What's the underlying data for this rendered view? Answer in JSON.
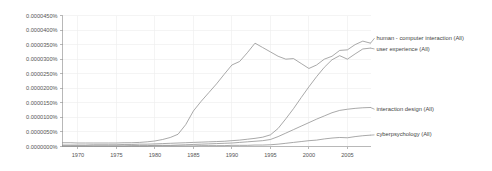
{
  "chart_data": {
    "type": "line",
    "title": "",
    "subtitle": "",
    "xlabel": "",
    "ylabel": "",
    "xlim": [
      1968,
      2008
    ],
    "ylim": [
      0,
      4.5e-05
    ],
    "grid": true,
    "legend_position": "right-inline",
    "y_tick_labels": [
      "0.0000450%",
      "0.0000400%",
      "0.0000350%",
      "0.0000300%",
      "0.0000250%",
      "0.0000200%",
      "0.0000150%",
      "0.0000100%",
      "0.0000050%",
      "0.0000000%"
    ],
    "y_tick_values": [
      4.5e-05,
      4e-05,
      3.5e-05,
      3e-05,
      2.5e-05,
      2e-05,
      1.5e-05,
      1e-05,
      5e-06,
      0.0
    ],
    "x_tick_labels": [
      "1970",
      "1975",
      "1980",
      "1985",
      "1990",
      "1995",
      "2000",
      "2005"
    ],
    "x_tick_values": [
      1970,
      1975,
      1980,
      1985,
      1990,
      1995,
      2000,
      2005
    ],
    "x": [
      1968,
      1969,
      1970,
      1971,
      1972,
      1973,
      1974,
      1975,
      1976,
      1977,
      1978,
      1979,
      1980,
      1981,
      1982,
      1983,
      1984,
      1985,
      1986,
      1987,
      1988,
      1989,
      1990,
      1991,
      1992,
      1993,
      1994,
      1995,
      1996,
      1997,
      1998,
      1999,
      2000,
      2001,
      2002,
      2003,
      2004,
      2005,
      2006,
      2007,
      2008
    ],
    "series": [
      {
        "name": "human - computer interaction (All)",
        "color": "#8c8c8c",
        "label_x": 2008,
        "label_y": 3.72e-05,
        "values": [
          1.3e-06,
          1.3e-06,
          1.2e-06,
          1.2e-06,
          1.2e-06,
          1.2e-06,
          1.2e-06,
          1.2e-06,
          1.3e-06,
          1.3e-06,
          1.4e-06,
          1.6e-06,
          1.9e-06,
          2.4e-06,
          3.1e-06,
          4.2e-06,
          7.5e-06,
          1.22e-05,
          1.55e-05,
          1.85e-05,
          2.15e-05,
          2.48e-05,
          2.8e-05,
          2.92e-05,
          3.22e-05,
          3.55e-05,
          3.4e-05,
          3.25e-05,
          3.1e-05,
          3e-05,
          3.02e-05,
          2.85e-05,
          2.68e-05,
          2.8e-05,
          3e-05,
          3.1e-05,
          3.3e-05,
          3.32e-05,
          3.5e-05,
          3.62e-05,
          3.55e-05
        ]
      },
      {
        "name": "user experience (All)",
        "color": "#8c8c8c",
        "label_x": 2008,
        "label_y": 3.35e-05,
        "values": [
          5e-07,
          5e-07,
          5e-07,
          5e-07,
          6e-07,
          6e-07,
          6e-07,
          6e-07,
          7e-07,
          7e-07,
          8e-07,
          8e-07,
          9e-07,
          1e-06,
          1.1e-06,
          1.2e-06,
          1.3e-06,
          1.4e-06,
          1.5e-06,
          1.6e-06,
          1.7e-06,
          1.8e-06,
          2e-06,
          2.2e-06,
          2.5e-06,
          2.8e-06,
          3.2e-06,
          4e-06,
          6.2e-06,
          9.5e-06,
          1.3e-05,
          1.68e-05,
          2.05e-05,
          2.4e-05,
          2.72e-05,
          2.98e-05,
          3.12e-05,
          3e-05,
          3.18e-05,
          3.35e-05,
          3.38e-05
        ]
      },
      {
        "name": "interaction design (All)",
        "color": "#8c8c8c",
        "label_x": 2008,
        "label_y": 1.28e-05,
        "values": [
          2e-07,
          2e-07,
          2e-07,
          2e-07,
          2e-07,
          2e-07,
          2e-07,
          2e-07,
          2e-07,
          3e-07,
          3e-07,
          3e-07,
          4e-07,
          4e-07,
          4e-07,
          5e-07,
          6e-07,
          7e-07,
          8e-07,
          9e-07,
          1e-06,
          1.1e-06,
          1.2e-06,
          1.4e-06,
          1.6e-06,
          1.8e-06,
          2e-06,
          2.4e-06,
          3.4e-06,
          4.6e-06,
          5.8e-06,
          7e-06,
          8.2e-06,
          9.4e-06,
          1.05e-05,
          1.16e-05,
          1.24e-05,
          1.28e-05,
          1.31e-05,
          1.33e-05,
          1.34e-05
        ]
      },
      {
        "name": "cyberpsychology (All)",
        "color": "#8c8c8c",
        "label_x": 2008,
        "label_y": 4e-06,
        "values": [
          1e-07,
          1e-07,
          1e-07,
          1e-07,
          1e-07,
          1e-07,
          1e-07,
          1e-07,
          1e-07,
          1e-07,
          1e-07,
          1e-07,
          2e-07,
          2e-07,
          2e-07,
          2e-07,
          2e-07,
          2e-07,
          3e-07,
          3e-07,
          3e-07,
          3e-07,
          4e-07,
          4e-07,
          4e-07,
          5e-07,
          5e-07,
          6e-07,
          8e-07,
          1.1e-06,
          1.4e-06,
          1.7e-06,
          2e-06,
          2.2e-06,
          2.6e-06,
          2.9e-06,
          3.1e-06,
          3e-06,
          3.4e-06,
          3.7e-06,
          3.9e-06
        ]
      }
    ]
  }
}
